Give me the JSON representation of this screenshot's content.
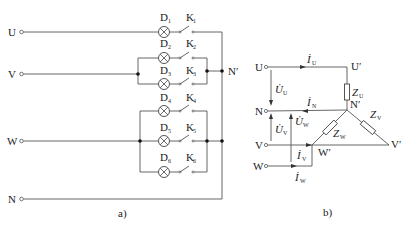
{
  "figure_a": {
    "caption": "a)",
    "terminals": [
      {
        "label": "U",
        "y": 32
      },
      {
        "label": "V",
        "y": 74
      },
      {
        "label": "W",
        "y": 141
      },
      {
        "label": "N",
        "y": 199
      }
    ],
    "neutral_point_label": "N′",
    "branches": [
      {
        "lamp": "D",
        "lamp_sub": "1",
        "switch": "K",
        "switch_sub": "1",
        "y": 32
      },
      {
        "lamp": "D",
        "lamp_sub": "2",
        "switch": "K",
        "switch_sub": "2",
        "y": 58
      },
      {
        "lamp": "D",
        "lamp_sub": "3",
        "switch": "K",
        "switch_sub": "3",
        "y": 84
      },
      {
        "lamp": "D",
        "lamp_sub": "4",
        "switch": "K",
        "switch_sub": "4",
        "y": 111
      },
      {
        "lamp": "D",
        "lamp_sub": "5",
        "switch": "K",
        "switch_sub": "5",
        "y": 141
      },
      {
        "lamp": "D",
        "lamp_sub": "6",
        "switch": "K",
        "switch_sub": "6",
        "y": 172
      }
    ]
  },
  "figure_b": {
    "caption": "b)",
    "terminals": {
      "U": "U",
      "N": "N",
      "V": "V",
      "W": "W"
    },
    "nodes": {
      "U_prime": "U′",
      "N_prime": "N′",
      "V_prime": "V′",
      "W_prime": "W′"
    },
    "currents": {
      "I_U": {
        "main": "İ",
        "sub": "U"
      },
      "I_N": {
        "main": "İ",
        "sub": "N"
      },
      "I_V": {
        "main": "İ",
        "sub": "V"
      },
      "I_W": {
        "main": "İ",
        "sub": "W"
      }
    },
    "voltages": {
      "U_U": {
        "main": "U̇",
        "sub": "U"
      },
      "U_V": {
        "main": "U̇",
        "sub": "V"
      },
      "U_W": {
        "main": "U̇",
        "sub": "W"
      }
    },
    "impedances": {
      "Z_U": {
        "main": "Z",
        "sub": "U"
      },
      "Z_V": {
        "main": "Z",
        "sub": "V"
      },
      "Z_W": {
        "main": "Z",
        "sub": "W"
      }
    }
  }
}
